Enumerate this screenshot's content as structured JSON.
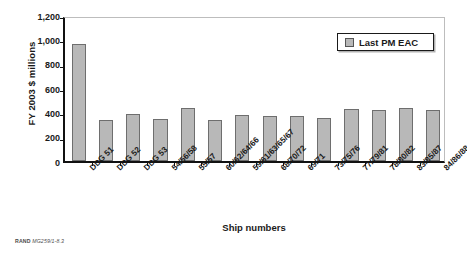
{
  "chart_data": {
    "type": "bar",
    "title": "",
    "xlabel": "Ship numbers",
    "ylabel": "FY 2003 $ millions",
    "ylim": [
      0,
      1200
    ],
    "yticks": [
      0,
      200,
      400,
      600,
      800,
      1000,
      1200
    ],
    "ytick_labels": [
      "0",
      "200",
      "400",
      "600",
      "800",
      "1,000",
      "1,200"
    ],
    "grid": false,
    "legend_position": "upper right",
    "legend_entries": [
      "Last PM EAC"
    ],
    "categories": [
      "DDG 51",
      "DDG 52",
      "DDG 53",
      "54/56/58",
      "55/57",
      "60/62/64/66",
      "59/61/63/65/67",
      "68/70/72",
      "69/71",
      "73/75/76",
      "77/79/81",
      "78/80/82",
      "83/85/87",
      "84/86/88"
    ],
    "series": [
      {
        "name": "Last PM EAC",
        "color": "#b8b8b8",
        "values": [
          960,
          340,
          390,
          348,
          432,
          340,
          375,
          366,
          369,
          354,
          425,
          420,
          437,
          420
        ]
      }
    ]
  },
  "legend": {
    "label": "Last PM EAC"
  },
  "axes": {
    "y_title": "FY 2003 $ millions",
    "x_title": "Ship numbers"
  },
  "footer": {
    "source_prefix": "RAND",
    "source_id": "MG259/1-8.3"
  }
}
